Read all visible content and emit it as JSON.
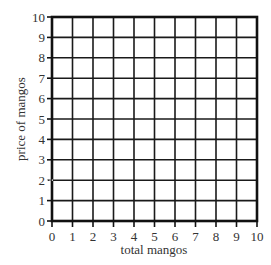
{
  "chart_data": {
    "type": "line",
    "title": "",
    "xlabel": "total mangos",
    "ylabel": "price of mangos",
    "xlim": [
      0,
      10
    ],
    "ylim": [
      0,
      10
    ],
    "x_ticks": [
      "0",
      "1",
      "2",
      "3",
      "4",
      "5",
      "6",
      "7",
      "8",
      "9",
      "10"
    ],
    "y_ticks": [
      "0",
      "1",
      "2",
      "3",
      "4",
      "5",
      "6",
      "7",
      "8",
      "9",
      "10"
    ],
    "grid": true,
    "series": [],
    "annotations": [
      {
        "type": "tick-mark",
        "axis": "y",
        "value": 2,
        "style": "dotted"
      }
    ],
    "legend": null
  },
  "colors": {
    "grid": "#1a1a1a",
    "border": "#111111",
    "text": "#333333",
    "background": "#ffffff"
  }
}
